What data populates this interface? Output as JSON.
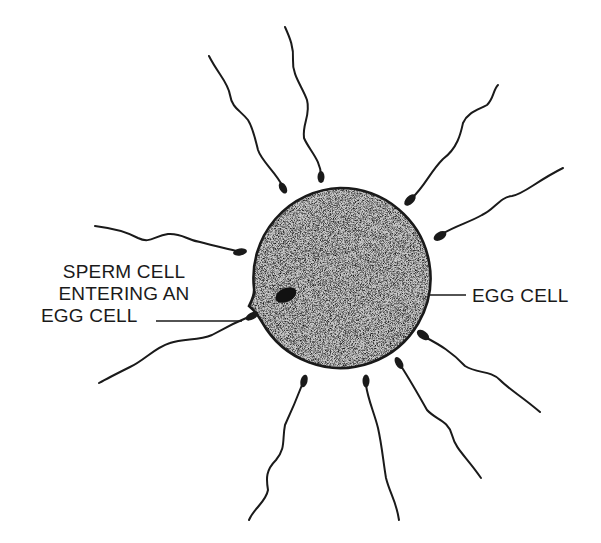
{
  "diagram": {
    "type": "biology-illustration",
    "labels": {
      "sperm_entering": {
        "line1": "SPERM CELL",
        "line2": "ENTERING AN",
        "line3": "EGG CELL"
      },
      "egg": "EGG CELL"
    },
    "colors": {
      "ink": "#1a1a1a",
      "egg_fill": "#b8b8b8",
      "background": "#ffffff"
    },
    "egg_cell": {
      "cx": 340,
      "cy": 278,
      "r": 90
    },
    "sperm_count": 11
  }
}
